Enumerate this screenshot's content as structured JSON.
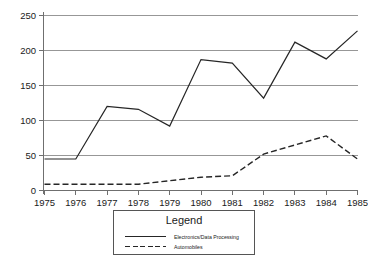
{
  "chart_data": {
    "type": "line",
    "title": "",
    "xlabel": "",
    "ylabel": "",
    "categories": [
      "1975",
      "1976",
      "1977",
      "1978",
      "1979",
      "1980",
      "1981",
      "1982",
      "1983",
      "1984",
      "1985"
    ],
    "x": [
      1975,
      1976,
      1977,
      1978,
      1979,
      1980,
      1981,
      1982,
      1983,
      1984,
      1985
    ],
    "series": [
      {
        "name": "Electronics/Data Processing",
        "style": "solid",
        "color": "#262626",
        "values": [
          45,
          45,
          120,
          116,
          92,
          187,
          182,
          132,
          212,
          188,
          228
        ]
      },
      {
        "name": "Automobiles",
        "style": "dashed",
        "color": "#262626",
        "values": [
          9,
          9,
          9,
          9,
          14,
          19,
          21,
          52,
          65,
          78,
          45
        ]
      }
    ],
    "ylim": [
      0,
      250
    ],
    "yticks": [
      0,
      50,
      100,
      150,
      200,
      250
    ],
    "ytick_labels": [
      "0",
      "50",
      "100",
      "150",
      "200",
      "250"
    ],
    "xtick_labels": [
      "1975",
      "1976",
      "1977",
      "1978",
      "1979",
      "1980",
      "1981",
      "1982",
      "1983",
      "1984",
      "1985"
    ],
    "grid": true,
    "grid_axis": "y",
    "legend_position": "below-center"
  },
  "legend": {
    "title": "Legend",
    "entries": [
      {
        "label": "Electronics/Data Processing",
        "style": "solid"
      },
      {
        "label": "Automobiles",
        "style": "dashed"
      }
    ]
  },
  "axes": {
    "y_labels": [
      "250",
      "200",
      "150",
      "100",
      "50",
      "0"
    ],
    "x_labels": [
      "1975",
      "1976",
      "1977",
      "1978",
      "1979",
      "1980",
      "1981",
      "1982",
      "1983",
      "1984",
      "1985"
    ]
  },
  "colors": {
    "line": "#262626",
    "grid": "#8c8c8c",
    "axis": "#6f6f6f",
    "background": "#ffffff",
    "text": "#1a1a1a"
  }
}
